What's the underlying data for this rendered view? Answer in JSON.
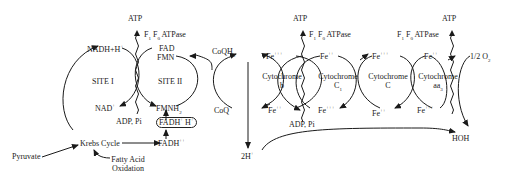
{
  "diagram": {
    "type": "electron-transport-chain",
    "atp": [
      "ATP",
      "ATP",
      "ATP"
    ],
    "atpase": {
      "prefix": "F",
      "sub1": "1",
      "mid": " F",
      "sub2": "0",
      "suffix": " ATPase"
    },
    "adp": [
      "ADP, Pi",
      "ADP, Pi"
    ],
    "site1": {
      "label": "SITE I",
      "top": "NADH+H",
      "top_sup": "+",
      "bottom": "NAD",
      "bottom_sup": "+"
    },
    "site2": {
      "label": "SITE II",
      "top1": "FAD",
      "top2": "FMN",
      "bottom": "FMNH",
      "bottom_sub": "2",
      "boxed": "FADH",
      "boxed_sup1": "+",
      "boxed_mid": " H",
      "boxed_sup2": "+"
    },
    "coq": {
      "top": "CoQH",
      "top_sub": "2",
      "bottom": "CoQ"
    },
    "cyt_b": {
      "name": "Cytochrome",
      "sub": "b",
      "top": "Fe",
      "top_sup": "+++",
      "bottom": "Fe",
      "bottom_sup": "++"
    },
    "cyt_c1": {
      "name": "Cytochrome",
      "sub": "C",
      "sub_sub": "1",
      "top": "Fe",
      "top_sup": "++",
      "bottom": "Fe",
      "bottom_sup": "+++"
    },
    "cyt_c": {
      "name": "Cytochrome",
      "sub": "C",
      "top": "Fe",
      "top_sup": "+++",
      "bottom": "Fe",
      "bottom_sup": "++"
    },
    "cyt_aa3": {
      "name": "Cytochrome",
      "sub": "aa",
      "sub_sub": "3",
      "top": "Fe",
      "top_sup": "++",
      "bottom": "Fe",
      "bottom_sup": "+++"
    },
    "oxygen": {
      "label": "1/2 O",
      "sub": "2"
    },
    "water": "HOH",
    "protons": {
      "label": "2H",
      "sup": "+"
    },
    "fadh": {
      "label": "FADH",
      "sup": "++"
    },
    "krebs": "Krebs Cycle",
    "pyruvate": "Pyruvate",
    "fatty_acid": [
      "Fatty Acid",
      "Oxidation"
    ]
  }
}
